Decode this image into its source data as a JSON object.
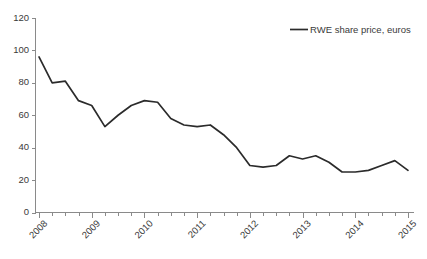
{
  "chart_data": {
    "type": "line",
    "title": "",
    "xlabel": "",
    "ylabel": "",
    "ylim": [
      0,
      120
    ],
    "ytick_step": 20,
    "yticks": [
      "0",
      "20",
      "40",
      "60",
      "80",
      "100",
      "120"
    ],
    "xticks": [
      "2008",
      "2009",
      "2010",
      "2011",
      "2012",
      "2013",
      "2014",
      "2015"
    ],
    "xtick_minor_per_year": 4,
    "grid": false,
    "legend_position": "top-right",
    "legend": [
      "RWE share price, euros"
    ],
    "series": [
      {
        "name": "RWE share price, euros",
        "color": "#2b2b2b",
        "x": [
          2008.0,
          2008.25,
          2008.5,
          2008.75,
          2009.0,
          2009.25,
          2009.5,
          2009.75,
          2010.0,
          2010.25,
          2010.5,
          2010.75,
          2011.0,
          2011.25,
          2011.5,
          2011.75,
          2012.0,
          2012.25,
          2012.5,
          2012.75,
          2013.0,
          2013.25,
          2013.5,
          2013.75,
          2014.0,
          2014.25,
          2014.5,
          2014.75,
          2015.0
        ],
        "values": [
          96,
          80,
          81,
          69,
          66,
          53,
          60,
          66,
          69,
          68,
          58,
          54,
          53,
          54,
          48,
          40,
          29,
          28,
          29,
          35,
          33,
          35,
          31,
          25,
          25,
          26,
          29,
          32,
          26
        ]
      }
    ]
  },
  "axes": {
    "y_axis_name": "value-axis",
    "x_axis_name": "year-axis"
  }
}
